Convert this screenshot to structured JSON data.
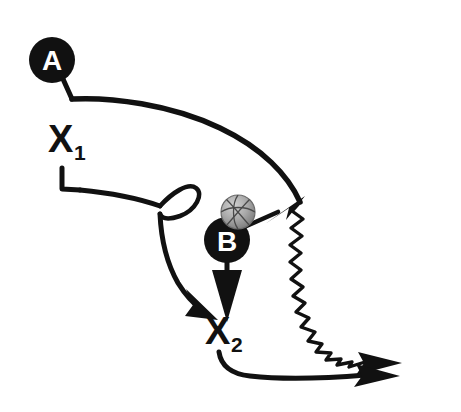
{
  "diagram": {
    "background_color": "#ffffff",
    "ink_color": "#111111",
    "ball_color": "#a8a8a8",
    "width": 461,
    "height": 412,
    "players": [
      {
        "id": "A",
        "label": "A",
        "type": "offense-circle",
        "fill": "#111111",
        "text_color": "#ffffff",
        "cx": 52,
        "cy": 60,
        "r": 23
      },
      {
        "id": "B",
        "label": "B",
        "type": "offense-circle",
        "fill": "#111111",
        "text_color": "#ffffff",
        "cx": 227,
        "cy": 240,
        "r": 23
      },
      {
        "id": "X1",
        "label": "X",
        "subscript": "1",
        "type": "defense-label",
        "x": 48,
        "y": 152
      },
      {
        "id": "X2",
        "label": "X",
        "subscript": "2",
        "type": "defense-label",
        "x": 205,
        "y": 344
      }
    ],
    "ball": {
      "name": "basketball",
      "cx": 238,
      "cy": 212,
      "r": 17,
      "fill": "#a8a8a8",
      "seam_color": "#3a3a3a"
    },
    "movements": [
      {
        "id": "a-cut",
        "from": "A",
        "kind": "cut-path",
        "description": "A cuts right and down to the ball-side wing"
      },
      {
        "id": "a-dribble",
        "from": "A",
        "kind": "dribble-zigzag",
        "description": "A dribbles down the right side and out"
      },
      {
        "id": "x1-curl",
        "from": "X1",
        "kind": "cut-path-with-loop",
        "description": "X1 moves right, curls, then cuts down to X2"
      },
      {
        "id": "b-screen-down",
        "from": "B",
        "kind": "straight-arrow",
        "description": "B moves straight down toward X2"
      },
      {
        "id": "b-pass",
        "from": "B",
        "kind": "pass-arrow",
        "description": "B passes the ball up-right to A"
      },
      {
        "id": "x2-slide",
        "from": "X2",
        "kind": "cut-path",
        "description": "X2 slides right along the baseline"
      }
    ]
  }
}
